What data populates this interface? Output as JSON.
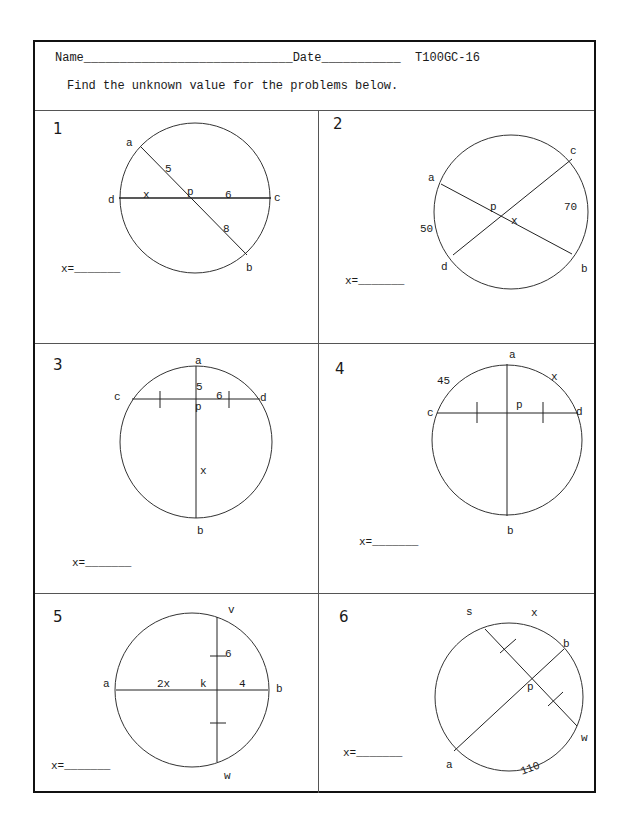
{
  "header": {
    "name_label": "Name",
    "date_label": "Date",
    "code": "T100GC-16",
    "instructions": "Find the unknown value for the problems below."
  },
  "answer_label": "x=",
  "problems": [
    {
      "number": "1",
      "labels": {
        "a": "a",
        "b": "b",
        "c": "c",
        "d": "d",
        "p": "p",
        "seg_ap": "5",
        "seg_pb": "8",
        "seg_pc": "6",
        "seg_dp": "x"
      }
    },
    {
      "number": "2",
      "labels": {
        "a": "a",
        "b": "b",
        "c": "c",
        "d": "d",
        "p": "p",
        "angle": "x",
        "arc_ad": "50",
        "arc_cb": "70"
      }
    },
    {
      "number": "3",
      "labels": {
        "a": "a",
        "b": "b",
        "c": "c",
        "d": "d",
        "p": "p",
        "seg_ap": "5",
        "seg_pd": "6",
        "seg_pb": "x"
      }
    },
    {
      "number": "4",
      "labels": {
        "a": "a",
        "b": "b",
        "c": "c",
        "d": "d",
        "p": "p",
        "arc_ca": "45",
        "arc_ad": "x"
      }
    },
    {
      "number": "5",
      "labels": {
        "a": "a",
        "b": "b",
        "v": "v",
        "w": "w",
        "k": "k",
        "seg_ak": "2x",
        "seg_kb": "4",
        "seg_vk": "6"
      }
    },
    {
      "number": "6",
      "labels": {
        "s": "s",
        "b": "b",
        "w": "w",
        "a": "a",
        "p": "p",
        "arc_sb": "x",
        "arc_aw": "110"
      }
    }
  ]
}
